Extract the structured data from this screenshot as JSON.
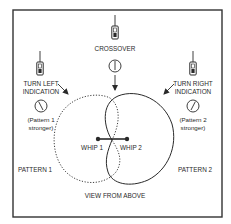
{
  "diagram": {
    "title": "VIEW FROM ABOVE",
    "colors": {
      "ink": "#2a2a2a",
      "frame": "#333333",
      "background": "#ffffff"
    },
    "crossover": {
      "label": "CROSSOVER",
      "icon": "handheld-radio-icon",
      "meter": "meter-needle-center-icon"
    },
    "turn_left": {
      "label_line1": "TURN LEFT",
      "label_line2": "INDICATION",
      "note_line1": "(Pattern 1",
      "note_line2": "stronger)",
      "icon": "handheld-radio-icon",
      "meter": "meter-needle-left-icon"
    },
    "turn_right": {
      "label_line1": "TURN RIGHT",
      "label_line2": "INDICATION",
      "note_line1": "(Pattern 2",
      "note_line2": "stronger)",
      "icon": "handheld-radio-icon",
      "meter": "meter-needle-right-icon"
    },
    "patterns": [
      {
        "label": "PATTERN 1",
        "style": "dotted"
      },
      {
        "label": "PATTERN 2",
        "style": "solid"
      }
    ],
    "whips": [
      {
        "label": "WHIP 1"
      },
      {
        "label": "WHIP 2"
      }
    ]
  }
}
